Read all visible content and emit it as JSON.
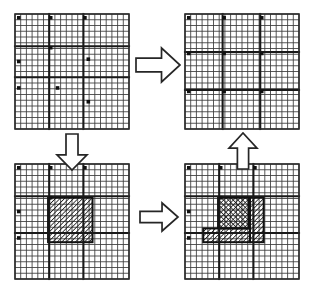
{
  "figure": {
    "background_color": "#ffffff",
    "line_color": "#3a3a3a",
    "thick_line_color": "#191919",
    "marker_color": "#111111",
    "arrow_fill": "#ffffff",
    "arrow_stroke": "#262626",
    "canvas": {
      "width": 315,
      "height": 295
    }
  },
  "panels": [
    {
      "id": "panel-top-left",
      "name": "initial-irregular-mesh",
      "position": {
        "x": 15,
        "y": 14,
        "width": 114,
        "height": 115
      },
      "grid": {
        "columns": 20,
        "rows": 20
      },
      "description": "Uniform fine grid with irregular block-boundary lines and corner node markers",
      "block_lines_vertical": [
        0.3,
        0.6
      ],
      "block_lines_horizontal": [
        0.28,
        0.55
      ],
      "markers": [
        {
          "x": 0.02,
          "y": 0.02
        },
        {
          "x": 0.3,
          "y": 0.02
        },
        {
          "x": 0.6,
          "y": 0.02
        },
        {
          "x": 0.3,
          "y": 0.28
        },
        {
          "x": 0.63,
          "y": 0.38
        },
        {
          "x": 0.02,
          "y": 0.4
        },
        {
          "x": 0.02,
          "y": 0.63
        },
        {
          "x": 0.36,
          "y": 0.63
        },
        {
          "x": 0.63,
          "y": 0.75
        }
      ]
    },
    {
      "id": "panel-top-right",
      "name": "regularized-block-mesh",
      "position": {
        "x": 185,
        "y": 14,
        "width": 114,
        "height": 115
      },
      "grid": {
        "columns": 20,
        "rows": 20
      },
      "description": "Uniform fine grid divided into regular 3 by 3 blocks with node markers at block corners",
      "block_lines_vertical": [
        0.33,
        0.66
      ],
      "block_lines_horizontal": [
        0.33,
        0.66
      ],
      "markers": [
        {
          "x": 0.02,
          "y": 0.02
        },
        {
          "x": 0.33,
          "y": 0.02
        },
        {
          "x": 0.66,
          "y": 0.02
        },
        {
          "x": 0.02,
          "y": 0.33
        },
        {
          "x": 0.33,
          "y": 0.33
        },
        {
          "x": 0.66,
          "y": 0.33
        },
        {
          "x": 0.02,
          "y": 0.66
        },
        {
          "x": 0.33,
          "y": 0.66
        },
        {
          "x": 0.66,
          "y": 0.66
        }
      ]
    },
    {
      "id": "panel-bottom-left",
      "name": "flagged-refinement-region",
      "position": {
        "x": 15,
        "y": 164,
        "width": 114,
        "height": 115
      },
      "grid": {
        "columns": 20,
        "rows": 20
      },
      "description": "Fine grid with a single large diagonally hatched region flagged for refinement",
      "block_lines_vertical": [
        0.3,
        0.6
      ],
      "block_lines_horizontal": [
        0.28,
        0.6
      ],
      "markers": [
        {
          "x": 0.02,
          "y": 0.02
        },
        {
          "x": 0.3,
          "y": 0.02
        },
        {
          "x": 0.6,
          "y": 0.02
        },
        {
          "x": 0.3,
          "y": 0.28
        },
        {
          "x": 0.02,
          "y": 0.4
        },
        {
          "x": 0.02,
          "y": 0.63
        }
      ],
      "hatched_regions": [
        {
          "name": "flagged-block",
          "x": 0.29,
          "y": 0.29,
          "width": 0.39,
          "height": 0.39,
          "pattern": "diagonal"
        }
      ]
    },
    {
      "id": "panel-bottom-right",
      "name": "partitioned-refinement-blocks",
      "position": {
        "x": 185,
        "y": 164,
        "width": 114,
        "height": 115
      },
      "grid": {
        "columns": 20,
        "rows": 20
      },
      "description": "Fine grid with flagged area split into three sub-blocks: cross-hatched square, diagonal vertical strip and diagonal lower block",
      "block_lines_vertical": [
        0.3,
        0.6
      ],
      "block_lines_horizontal": [
        0.28,
        0.6
      ],
      "markers": [
        {
          "x": 0.02,
          "y": 0.02
        },
        {
          "x": 0.3,
          "y": 0.02
        },
        {
          "x": 0.6,
          "y": 0.02
        },
        {
          "x": 0.3,
          "y": 0.28
        },
        {
          "x": 0.02,
          "y": 0.4
        },
        {
          "x": 0.02,
          "y": 0.63
        }
      ],
      "hatched_regions": [
        {
          "name": "crosshatch-block",
          "x": 0.29,
          "y": 0.29,
          "width": 0.27,
          "height": 0.27,
          "pattern": "cross"
        },
        {
          "name": "diagonal-strip-right",
          "x": 0.57,
          "y": 0.29,
          "width": 0.12,
          "height": 0.39,
          "pattern": "diagonal"
        },
        {
          "name": "diagonal-block-lower",
          "x": 0.16,
          "y": 0.56,
          "width": 0.41,
          "height": 0.12,
          "pattern": "diagonal"
        }
      ]
    }
  ],
  "arrows": [
    {
      "id": "arrow-top",
      "name": "arrow-top-left-to-top-right",
      "direction": "right",
      "position": {
        "x": 136,
        "y": 48,
        "width": 44,
        "height": 34
      }
    },
    {
      "id": "arrow-left",
      "name": "arrow-top-left-to-bottom-left",
      "direction": "down",
      "position": {
        "x": 57,
        "y": 134,
        "width": 30,
        "height": 36
      }
    },
    {
      "id": "arrow-bottom",
      "name": "arrow-bottom-left-to-bottom-right",
      "direction": "right",
      "position": {
        "x": 140,
        "y": 203,
        "width": 38,
        "height": 28
      }
    },
    {
      "id": "arrow-right",
      "name": "arrow-bottom-right-to-top-right",
      "direction": "up",
      "position": {
        "x": 229,
        "y": 133,
        "width": 28,
        "height": 36
      }
    }
  ]
}
